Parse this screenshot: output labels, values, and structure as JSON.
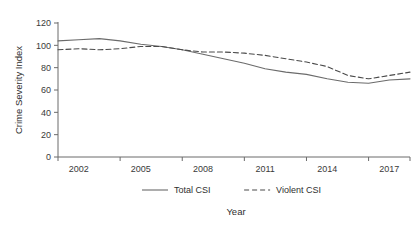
{
  "chart_data": {
    "type": "line",
    "title": "",
    "xlabel": "Year",
    "ylabel": "Crime Severity Index",
    "xlim": [
      2001,
      2018
    ],
    "ylim": [
      0,
      120
    ],
    "grid": false,
    "legend_position": "bottom",
    "x": [
      2001,
      2002,
      2003,
      2004,
      2005,
      2006,
      2007,
      2008,
      2009,
      2010,
      2011,
      2012,
      2013,
      2014,
      2015,
      2016,
      2017,
      2018
    ],
    "x_tick_labels": [
      "2002",
      "2005",
      "2008",
      "2011",
      "2014",
      "2017"
    ],
    "x_tick_values": [
      2002,
      2005,
      2008,
      2011,
      2014,
      2017
    ],
    "y_tick_labels": [
      "0",
      "20",
      "40",
      "60",
      "80",
      "100",
      "120"
    ],
    "y_tick_values": [
      0,
      20,
      40,
      60,
      80,
      100,
      120
    ],
    "series": [
      {
        "name": "Total CSI",
        "style": "solid",
        "color": "#6b6b6b",
        "values": [
          104,
          105,
          106,
          104,
          101,
          99,
          96,
          92,
          88,
          84,
          79,
          76,
          74,
          70,
          67,
          66,
          69,
          70
        ]
      },
      {
        "name": "Violent CSI",
        "style": "dashed",
        "color": "#4a4a4a",
        "values": [
          96,
          97,
          96,
          97,
          99,
          99,
          96,
          94,
          94,
          93,
          91,
          88,
          85,
          81,
          73,
          70,
          73,
          76
        ]
      }
    ]
  },
  "legend": {
    "items": [
      {
        "label": "Total CSI",
        "style": "solid"
      },
      {
        "label": "Violent CSI",
        "style": "dashed"
      }
    ]
  },
  "axes": {
    "y_title": "Crime Severity Index",
    "x_title": "Year"
  },
  "colors": {
    "total_csi": "#6b6b6b",
    "violent_csi": "#4a4a4a",
    "axis": "#6b6b6b",
    "text": "#2f2f2f",
    "background": "#ffffff"
  }
}
